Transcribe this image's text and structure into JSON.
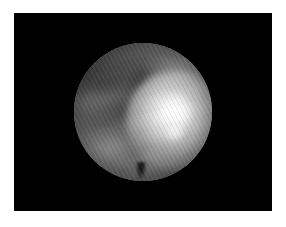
{
  "image": {
    "domain": "medical-endoscopy",
    "modality": "arthroscopic-endoscopic-still-frame",
    "color_mode": "grayscale",
    "alt_text": "Grayscale endoscopic still frame showing a circular field of view on a black background, with brightly illuminated tissue at right and darker shadowed tissue at left.",
    "caption": "",
    "frame": {
      "matte_color": "#ffffff",
      "matte_thickness_px": 14,
      "canvas_color": "#000000",
      "canvas_left_px": 14,
      "canvas_top_px": 13,
      "canvas_width_px": 258,
      "canvas_height_px": 198
    },
    "field_of_view": {
      "shape": "circle",
      "center_x_px": 143,
      "center_y_px": 112,
      "radius_px": 69,
      "diameter_px": 138
    },
    "texture": {
      "pattern": "diagonal-interlaced-scanlines",
      "angle_deg": 62,
      "period_px": 4
    },
    "tone_palette": {
      "background_black": "#000000",
      "matte_white": "#ffffff",
      "shadow_gray": "#3a3a3a",
      "mid_gray": "#6b6b6b",
      "light_gray": "#b0b0b0",
      "highlight_white": "#ffffff"
    },
    "regions": [
      {
        "id": "lobe-bright",
        "label": "Illuminated tissue lobe",
        "position": "right-of-center",
        "brightness": "high"
      },
      {
        "id": "specular",
        "label": "Primary specular highlight",
        "position": "center-right",
        "brightness": "maximum"
      },
      {
        "id": "specular-2",
        "label": "Secondary specular highlight",
        "position": "lower-right-of-center",
        "brightness": "maximum"
      },
      {
        "id": "seam-left",
        "label": "Dark tissue seam",
        "position": "mid-left",
        "brightness": "low"
      },
      {
        "id": "trough",
        "label": "Shadowed trough",
        "position": "center-left",
        "brightness": "low"
      },
      {
        "id": "arc-lower-left",
        "label": "Lighter tissue arc",
        "position": "lower-left",
        "brightness": "medium"
      },
      {
        "id": "bulge-bottom",
        "label": "Lighter tissue bulge",
        "position": "bottom-center",
        "brightness": "medium"
      },
      {
        "id": "notch-instrument",
        "label": "Dark instrument tip notch",
        "position": "bottom-center-rim",
        "brightness": "minimum"
      },
      {
        "id": "rim-spill",
        "label": "Light spill near upper rim",
        "position": "upper-right",
        "brightness": "medium-high"
      }
    ]
  }
}
